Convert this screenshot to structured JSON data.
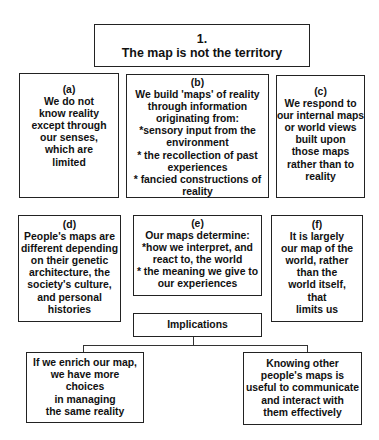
{
  "title": {
    "number": "1.",
    "text": "The map is not the territory"
  },
  "boxes": {
    "a": {
      "label": "(a)",
      "lines": [
        "We do not",
        "know reality",
        "except through",
        "our senses,",
        "which are",
        "limited"
      ]
    },
    "b": {
      "label": "(b)",
      "lines": [
        "We build 'maps' of reality",
        "through information",
        "originating from:",
        "*sensory input from the",
        "environment",
        "* the recollection of past",
        "experiences",
        "* fancied constructions of",
        "reality"
      ]
    },
    "c": {
      "label": "(c)",
      "lines": [
        "We respond to",
        "our  internal maps",
        "or world views",
        "built upon",
        "those maps",
        "rather than to",
        "reality"
      ]
    },
    "d": {
      "label": "(d)",
      "lines": [
        "People's maps are",
        "different depending",
        "on their genetic",
        "architecture, the",
        "society's culture,",
        "and personal",
        "histories"
      ]
    },
    "e": {
      "label": "(e)",
      "lines": [
        "Our maps determine:",
        "*how we interpret, and",
        "react to, the world",
        "* the meaning we give to",
        "our experiences"
      ]
    },
    "f": {
      "label": "(f)",
      "lines": [
        "It is largely",
        "our map of the",
        "world, rather",
        "than the",
        "world itself,",
        "that",
        "limits us"
      ]
    }
  },
  "implications": {
    "label": "Implications",
    "left": {
      "lines": [
        "If we enrich our map,",
        "we have more",
        "choices",
        "in managing",
        "the same reality"
      ]
    },
    "right": {
      "lines": [
        "Knowing other",
        "people's maps is",
        "useful to communicate",
        "and interact with",
        "them effectively"
      ]
    }
  },
  "colors": {
    "border": "#222222",
    "text": "#111111",
    "background": "#ffffff"
  }
}
